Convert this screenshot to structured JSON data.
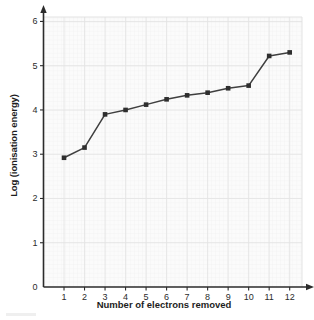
{
  "chart_data": {
    "type": "line",
    "title": "",
    "xlabel": "Number of electrons removed",
    "ylabel": "Log (ionisation energy)",
    "x": [
      1,
      2,
      3,
      4,
      5,
      6,
      7,
      8,
      9,
      10,
      11,
      12
    ],
    "values": [
      2.92,
      3.15,
      3.9,
      4.0,
      4.12,
      4.24,
      4.33,
      4.39,
      4.49,
      4.55,
      5.22,
      5.3
    ],
    "series": [
      {
        "name": "Log (ionisation energy)",
        "values": [
          2.92,
          3.15,
          3.9,
          4.0,
          4.12,
          4.24,
          4.33,
          4.39,
          4.49,
          4.55,
          5.22,
          5.3
        ]
      }
    ],
    "xlim": [
      0,
      12.6
    ],
    "ylim": [
      0,
      6.1
    ],
    "xticks": [
      1,
      2,
      3,
      4,
      5,
      6,
      7,
      8,
      9,
      10,
      11,
      12
    ],
    "yticks": [
      0,
      1,
      2,
      3,
      4,
      5,
      6
    ],
    "xtick_labels": [
      "1",
      "2",
      "3",
      "4",
      "5",
      "6",
      "7",
      "8",
      "9",
      "10",
      "11",
      "12"
    ],
    "ytick_labels": [
      "0",
      "1",
      "2",
      "3",
      "4",
      "5",
      "6"
    ],
    "grid": true,
    "minor_grid": true,
    "legend": false,
    "legend_position": "none",
    "marker": "square",
    "line_color": "#3f3f3f",
    "marker_color": "#2e2e2e",
    "grid_color": "#e4e4e4",
    "minor_grid_color": "#f1f1f1",
    "axis_color": "#2b2b2b",
    "background_color": "#fbfbfb",
    "annotations": []
  },
  "axes": {
    "x_arrow": true,
    "y_arrow": true
  }
}
